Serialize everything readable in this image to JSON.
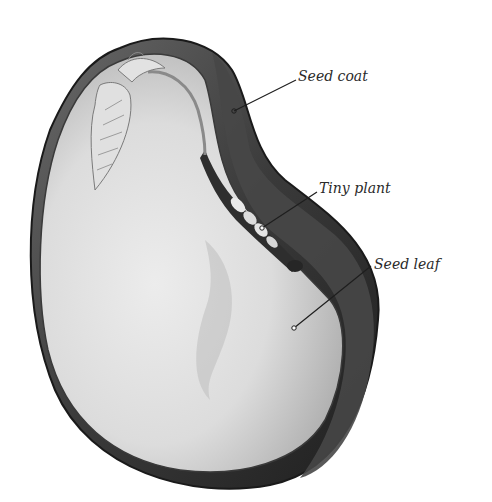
{
  "diagram": {
    "labels": [
      {
        "id": "seed-coat",
        "text": "Seed coat",
        "x": 298,
        "y": 69,
        "pointer": {
          "x1": 296,
          "y1": 80,
          "x2": 234,
          "y2": 111
        }
      },
      {
        "id": "tiny-plant",
        "text": "Tiny plant",
        "x": 319,
        "y": 181,
        "pointer": {
          "x1": 317,
          "y1": 192,
          "x2": 262,
          "y2": 228
        }
      },
      {
        "id": "seed-leaf",
        "text": "Seed leaf",
        "x": 374,
        "y": 257,
        "pointer": {
          "x1": 371,
          "y1": 266,
          "x2": 294,
          "y2": 328
        }
      }
    ],
    "colors": {
      "coat_dark": "#2b2b2b",
      "coat_mid": "#555555",
      "leaf_light": "#e6e6e6",
      "leaf_shadow": "#b5b5b5",
      "label_text": "#2a2a2a",
      "pointer_line": "#1e1e1e"
    }
  }
}
